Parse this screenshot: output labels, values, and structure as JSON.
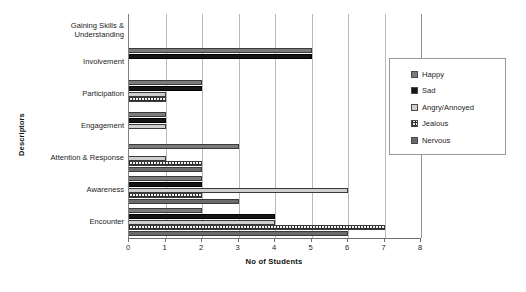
{
  "chart_data": {
    "type": "bar",
    "orientation": "horizontal",
    "title": "",
    "xlabel": "No of Students",
    "ylabel": "Descriptors",
    "xlim": [
      0,
      8
    ],
    "xticks": [
      0,
      1,
      2,
      3,
      4,
      5,
      6,
      7,
      8
    ],
    "grid": true,
    "legend_position": "right",
    "categories": [
      "Gaining Skills &\nUnderstanding",
      "Involvement",
      "Participation",
      "Engagement",
      "Attention & Response",
      "Awareness",
      "Encounter"
    ],
    "series": [
      {
        "name": "Happy",
        "color": "#7b7b7b",
        "pattern": "solid",
        "values": [
          0,
          5,
          2,
          1,
          3,
          2,
          2
        ]
      },
      {
        "name": "Sad",
        "color": "#151515",
        "pattern": "solid",
        "values": [
          0,
          5,
          2,
          1,
          0,
          2,
          4
        ]
      },
      {
        "name": "Angry/Annoyed",
        "color": "#cfcfcf",
        "pattern": "solid",
        "values": [
          0,
          0,
          1,
          1,
          1,
          6,
          4
        ]
      },
      {
        "name": "Jealous",
        "color": "#f2f2f2",
        "pattern": "crosshatch",
        "values": [
          0,
          0,
          1,
          0,
          2,
          2,
          7
        ]
      },
      {
        "name": "Nervous",
        "color": "#6a6a6a",
        "pattern": "solid",
        "values": [
          0,
          0,
          0,
          0,
          2,
          3,
          6
        ]
      }
    ]
  },
  "legend": {
    "items": [
      {
        "label": "Happy"
      },
      {
        "label": "Sad"
      },
      {
        "label": "Angry/Annoyed"
      },
      {
        "label": "Jealous"
      },
      {
        "label": "Nervous"
      }
    ]
  }
}
